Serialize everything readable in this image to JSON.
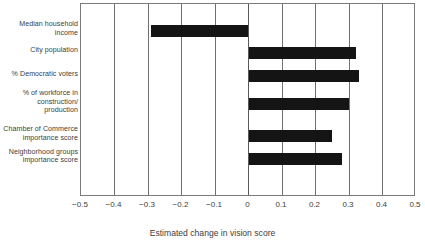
{
  "chart_data": {
    "type": "bar",
    "orientation": "horizontal",
    "title": "",
    "xlabel": "Estimated change in vision score",
    "ylabel": "",
    "xlim": [
      -0.5,
      0.5
    ],
    "xticks": [
      -0.5,
      -0.4,
      -0.3,
      -0.2,
      -0.1,
      0,
      0.1,
      0.2,
      0.3,
      0.4,
      0.5
    ],
    "xticklabels": [
      "−0.5",
      "−0.4",
      "−0.3",
      "−0.2",
      "−0.1",
      "0",
      "0.1",
      "0.2",
      "0.3",
      "0.4",
      "0.5"
    ],
    "grid": "vertical",
    "legend": "none",
    "bar_color": "#141414",
    "categories": [
      "Median household income",
      "City population",
      "% Democratic voters",
      "% of workforce in construction/ production",
      "Chamber of Commerce importance score",
      "Neighborhood groups importance score"
    ],
    "values": [
      -0.29,
      0.32,
      0.33,
      0.3,
      0.25,
      0.28
    ]
  },
  "labels": {
    "categories": [
      {
        "lines": [
          "Median household",
          "income"
        ]
      },
      {
        "lines": [
          "City population"
        ]
      },
      {
        "lines": [
          "% Democratic voters"
        ]
      },
      {
        "lines": [
          "% of workforce in",
          "construction/",
          "production"
        ]
      },
      {
        "lines": [
          "Chamber of Commerce",
          "importance score"
        ]
      },
      {
        "lines": [
          "Neighborhood groups",
          "importance score"
        ]
      }
    ]
  },
  "axis": {
    "x_title": "Estimated change in vision score"
  }
}
